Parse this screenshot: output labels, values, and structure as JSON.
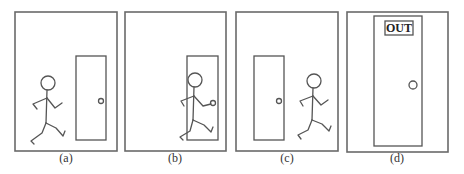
{
  "figure": {
    "panels": [
      {
        "id": "a",
        "caption": "(a)",
        "description": "stick figure running toward door on the right"
      },
      {
        "id": "b",
        "caption": "(b)",
        "description": "stick figure passing through the doorway"
      },
      {
        "id": "c",
        "caption": "(c)",
        "description": "stick figure has run past the door"
      },
      {
        "id": "d",
        "caption": "(d)",
        "description": "close-up of door labeled OUT"
      }
    ],
    "door_sign": "OUT"
  },
  "colors": {
    "stroke": "#555555",
    "frame": "#6a6a6a",
    "background": "#ffffff"
  }
}
